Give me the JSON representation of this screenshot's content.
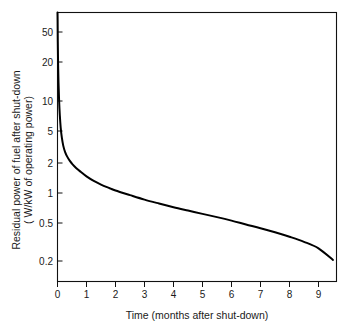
{
  "chart_data": {
    "type": "line",
    "title": "",
    "subtitle": "",
    "xlabel": "Time (months after shut-down)",
    "ylabel": "Residual power of fuel after shut-down ( W/kW of operating power)",
    "ylabel_line1": "Residual power of fuel after shut-down",
    "ylabel_line2": "( W/kW of operating power)",
    "yscale": "log",
    "xscale": "linear",
    "xlim": [
      0,
      9.8
    ],
    "ylim": [
      0.13,
      110
    ],
    "grid": false,
    "legend": null,
    "legend_position": "none",
    "xticks": [
      0,
      1,
      2,
      3,
      4,
      5,
      6,
      7,
      8,
      9
    ],
    "xtick_labels": [
      "0",
      "1",
      "2",
      "3",
      "4",
      "5",
      "6",
      "7",
      "8",
      "9"
    ],
    "yticks": [
      50,
      20,
      10,
      5,
      2,
      1,
      0.5,
      0.2
    ],
    "ytick_labels": [
      "50",
      "20",
      "10",
      "5",
      "2",
      "1",
      "0.5",
      "0.2"
    ],
    "series": [
      {
        "name": "Residual decay power",
        "x": [
          0.0,
          0.004,
          0.01,
          0.02,
          0.035,
          0.055,
          0.08,
          0.11,
          0.15,
          0.2,
          0.26,
          0.33,
          0.42,
          0.52,
          0.65,
          0.8,
          1.0,
          1.25,
          1.5,
          1.8,
          2.0,
          2.5,
          3.0,
          3.5,
          4.0,
          4.5,
          5.0,
          5.5,
          6.0,
          6.5,
          7.0,
          7.5,
          8.0,
          8.5,
          9.0,
          9.5
        ],
        "y": [
          95.0,
          60.0,
          36.0,
          22.0,
          13.5,
          9.0,
          6.3,
          4.7,
          3.7,
          3.05,
          2.65,
          2.38,
          2.15,
          1.97,
          1.8,
          1.65,
          1.48,
          1.33,
          1.22,
          1.12,
          1.06,
          0.95,
          0.855,
          0.78,
          0.715,
          0.66,
          0.61,
          0.565,
          0.52,
          0.475,
          0.435,
          0.395,
          0.355,
          0.315,
          0.27,
          0.205
        ]
      }
    ]
  },
  "axes": {
    "y_tick_labels": [
      "50",
      "20",
      "10",
      "5",
      "2",
      "1",
      "0.5",
      "0.2"
    ],
    "x_tick_labels": [
      "0",
      "1",
      "2",
      "3",
      "4",
      "5",
      "6",
      "7",
      "8",
      "9"
    ],
    "x_axis_title": "Time (months after shut-down)",
    "y_axis_title_line1": "Residual power of fuel after shut-down",
    "y_axis_title_line2": "( W/kW of operating power)"
  },
  "colors": {
    "curve": "#000000",
    "frame": "#111111",
    "text": "#1a1a1a",
    "background": "#ffffff"
  }
}
